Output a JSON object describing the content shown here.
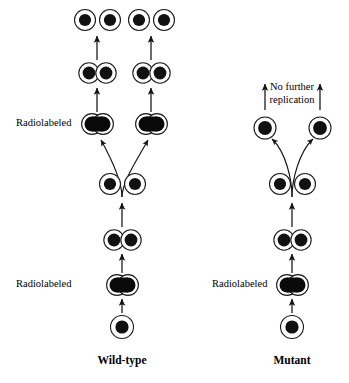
{
  "figure": {
    "type": "diagram",
    "background_color": "#ffffff",
    "ink_color": "#111111",
    "width": 349,
    "height": 383
  },
  "panels": [
    {
      "id": "wild-type",
      "title": "Wild-type",
      "title_x": 122,
      "title_y": 361,
      "center_x": 122,
      "radiolabel_note": {
        "text": "Radiolabeled",
        "occurrences": [
          {
            "x": 16,
            "y": 124
          },
          {
            "x": 16,
            "y": 285
          }
        ]
      },
      "stages": [
        {
          "name": "founder-cell",
          "kind": "single",
          "label": "single unlabeled cell",
          "y": 327,
          "cells": [
            {
              "cx": 122,
              "cy": 327,
              "hot": false
            }
          ]
        },
        {
          "name": "radiolabeled-dividing-cell-gen1",
          "kind": "fused-pair",
          "label": "radiolabeled dividing cell",
          "y": 285,
          "cells": [
            {
              "cx": 117,
              "cy": 285,
              "hot": true
            },
            {
              "cx": 128,
              "cy": 285,
              "hot": true
            }
          ]
        },
        {
          "name": "dividing-cell-gen2",
          "kind": "doublet",
          "label": "dividing cell",
          "y": 240,
          "cells": [
            {
              "cx": 114,
              "cy": 240,
              "hot": false
            },
            {
              "cx": 131,
              "cy": 240,
              "hot": false
            }
          ]
        },
        {
          "name": "separated-daughters-gen2",
          "kind": "separated-pair",
          "label": "two separated daughter cells",
          "y": 184,
          "cells": [
            {
              "cx": 110,
              "cy": 184,
              "hot": false
            },
            {
              "cx": 135,
              "cy": 184,
              "hot": false
            }
          ]
        },
        {
          "name": "radiolabeled-dividing-cells-gen3",
          "kind": "fused-pair-row",
          "label": "two radiolabeled dividing cells",
          "y": 124,
          "groups": [
            {
              "cells": [
                {
                  "cx": 92,
                  "cy": 124,
                  "hot": true
                },
                {
                  "cx": 103,
                  "cy": 124,
                  "hot": true
                }
              ]
            },
            {
              "cells": [
                {
                  "cx": 146,
                  "cy": 124,
                  "hot": true
                },
                {
                  "cx": 157,
                  "cy": 124,
                  "hot": true
                }
              ]
            }
          ]
        },
        {
          "name": "dividing-cells-gen4",
          "kind": "doublet-row",
          "label": "two dividing cells",
          "y": 73,
          "groups": [
            {
              "cells": [
                {
                  "cx": 89,
                  "cy": 73,
                  "hot": false
                },
                {
                  "cx": 106,
                  "cy": 73,
                  "hot": false
                }
              ]
            },
            {
              "cells": [
                {
                  "cx": 143,
                  "cy": 73,
                  "hot": false
                },
                {
                  "cx": 160,
                  "cy": 73,
                  "hot": false
                }
              ]
            }
          ]
        },
        {
          "name": "separated-daughters-gen4",
          "kind": "separated-pair-row",
          "label": "four separated daughter cells",
          "y": 20,
          "groups": [
            {
              "cells": [
                {
                  "cx": 85,
                  "cy": 20,
                  "hot": false
                },
                {
                  "cx": 110,
                  "cy": 20,
                  "hot": false
                }
              ]
            },
            {
              "cells": [
                {
                  "cx": 139,
                  "cy": 20,
                  "hot": false
                },
                {
                  "cx": 164,
                  "cy": 20,
                  "hot": false
                }
              ]
            }
          ]
        }
      ],
      "straight_arrows": [
        {
          "name": "arrow-founder-to-label",
          "x": 122,
          "y1": 313,
          "y2": 297
        },
        {
          "name": "arrow-label-to-doublet",
          "x": 122,
          "y1": 273,
          "y2": 253
        },
        {
          "name": "arrow-label-to-doublet-left",
          "x": 97,
          "y1": 112,
          "y2": 87
        },
        {
          "name": "arrow-label-to-doublet-right",
          "x": 151,
          "y1": 112,
          "y2": 87
        },
        {
          "name": "arrow-doublet-to-split-left",
          "x": 97,
          "y1": 60,
          "y2": 36
        },
        {
          "name": "arrow-doublet-to-split-right",
          "x": 151,
          "y1": 60,
          "y2": 36
        }
      ],
      "curve_arrows": [
        {
          "name": "curve-split-left",
          "from_x": 122,
          "from_y": 171,
          "to_x": 100,
          "to_y": 134
        },
        {
          "name": "curve-split-right",
          "from_x": 122,
          "from_y": 171,
          "to_x": 148,
          "to_y": 134
        }
      ],
      "split_stem": {
        "x": 122,
        "y1": 171,
        "y2": 197
      }
    },
    {
      "id": "mutant",
      "title": "Mutant",
      "title_x": 292,
      "title_y": 361,
      "center_x": 292,
      "radiolabel_note": {
        "text": "Radiolabeled",
        "occurrences": [
          {
            "x": 212,
            "y": 285
          }
        ]
      },
      "terminal_note": {
        "text_line_1": "No further",
        "text_line_2": "replication",
        "x": 292,
        "y1": 88,
        "y2": 101
      },
      "stages": [
        {
          "name": "founder-cell",
          "kind": "single",
          "label": "single unlabeled cell",
          "y": 327,
          "cells": [
            {
              "cx": 292,
              "cy": 327,
              "hot": false
            }
          ]
        },
        {
          "name": "radiolabeled-dividing-cell-gen1",
          "kind": "fused-pair",
          "label": "radiolabeled dividing cell",
          "y": 285,
          "cells": [
            {
              "cx": 287,
              "cy": 285,
              "hot": true
            },
            {
              "cx": 298,
              "cy": 285,
              "hot": true
            }
          ]
        },
        {
          "name": "dividing-cell-gen2",
          "kind": "doublet",
          "label": "dividing cell",
          "y": 240,
          "cells": [
            {
              "cx": 284,
              "cy": 240,
              "hot": false
            },
            {
              "cx": 301,
              "cy": 240,
              "hot": false
            }
          ]
        },
        {
          "name": "separated-daughters-gen2",
          "kind": "separated-pair",
          "label": "two separated daughter cells",
          "y": 184,
          "cells": [
            {
              "cx": 280,
              "cy": 184,
              "hot": false
            },
            {
              "cx": 305,
              "cy": 184,
              "hot": false
            }
          ]
        },
        {
          "name": "arrested-daughters",
          "kind": "separated-pair-wide",
          "label": "two arrested daughter cells",
          "y": 128,
          "cells": [
            {
              "cx": 265,
              "cy": 128,
              "hot": false
            },
            {
              "cx": 320,
              "cy": 128,
              "hot": false
            }
          ]
        }
      ],
      "straight_arrows": [
        {
          "name": "arrow-founder-to-label",
          "x": 292,
          "y1": 313,
          "y2": 297
        },
        {
          "name": "arrow-label-to-doublet",
          "x": 292,
          "y1": 273,
          "y2": 253
        },
        {
          "name": "arrow-no-replication-left",
          "x": 265,
          "y1": 110,
          "y2": 84
        },
        {
          "name": "arrow-no-replication-right",
          "x": 320,
          "y1": 110,
          "y2": 84
        }
      ],
      "curve_arrows": [
        {
          "name": "curve-split-left",
          "from_x": 292,
          "from_y": 171,
          "to_x": 270,
          "to_y": 136
        },
        {
          "name": "curve-split-right",
          "from_x": 292,
          "from_y": 171,
          "to_x": 315,
          "to_y": 136
        }
      ],
      "split_stem": {
        "x": 292,
        "y1": 171,
        "y2": 197
      }
    }
  ],
  "geometry": {
    "cell_radius": 10.5,
    "cell_radius_small": 9.5,
    "nucleus_radius": 6.0,
    "nucleus_radius_hot": 7.5
  }
}
